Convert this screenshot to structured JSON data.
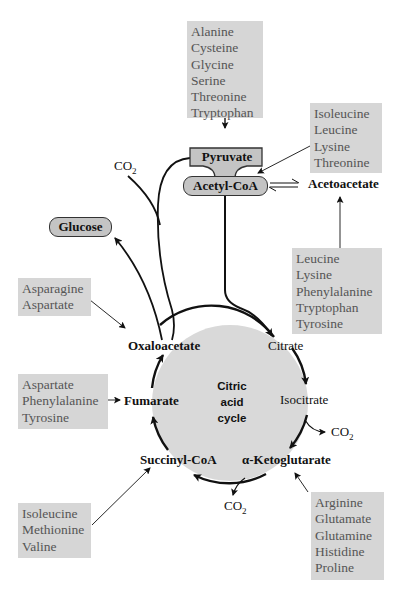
{
  "diagram": {
    "title": "Citric acid cycle",
    "center_label": [
      "Citric",
      "acid",
      "cycle"
    ],
    "intermediates": {
      "pyruvate": "Pyruvate",
      "acetyl_coa": "Acetyl-CoA",
      "glucose": "Glucose",
      "acetoacetate": "Acetoacetate",
      "oxaloacetate": "Oxaloacetate",
      "citrate": "Citrate",
      "isocitrate": "Isocitrate",
      "alpha_ketoglutarate": "α-Ketoglutarate",
      "succinyl_coa": "Succinyl-CoA",
      "fumarate": "Fumarate"
    },
    "co2": {
      "label": "CO",
      "subscript": "2"
    },
    "amino_acid_groups": {
      "to_pyruvate": [
        "Alanine",
        "Cysteine",
        "Glycine",
        "Serine",
        "Threonine",
        "Tryptophan"
      ],
      "to_acetyl_coa": [
        "Isoleucine",
        "Leucine",
        "Lysine",
        "Threonine"
      ],
      "to_acetoacetate": [
        "Leucine",
        "Lysine",
        "Phenylalanine",
        "Tryptophan",
        "Tyrosine"
      ],
      "to_oxaloacetate": [
        "Asparagine",
        "Aspartate"
      ],
      "to_fumarate": [
        "Aspartate",
        "Phenylalanine",
        "Tyrosine"
      ],
      "to_succinyl_coa": [
        "Isoleucine",
        "Methionine",
        "Valine"
      ],
      "to_alpha_ketoglutarate": [
        "Arginine",
        "Glutamate",
        "Glutamine",
        "Histidine",
        "Proline"
      ]
    },
    "colors": {
      "box_fill": "#d6d6d6",
      "box_text": "#555555",
      "node_fill": "#c4c4c4",
      "cycle_fill": "#d9d9d9",
      "line": "#111111"
    }
  }
}
